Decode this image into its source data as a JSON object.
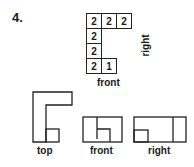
{
  "problem_number": "4.",
  "grid": {
    "cells": [
      {
        "row": 0,
        "col": 0,
        "value": "2"
      },
      {
        "row": 0,
        "col": 1,
        "value": "2"
      },
      {
        "row": 0,
        "col": 2,
        "value": "2"
      },
      {
        "row": 1,
        "col": 0,
        "value": "2"
      },
      {
        "row": 2,
        "col": 0,
        "value": "2"
      },
      {
        "row": 3,
        "col": 0,
        "value": "2"
      },
      {
        "row": 3,
        "col": 1,
        "value": "1"
      }
    ],
    "label_bottom": "front",
    "label_side": "right"
  },
  "views": {
    "top_label": "top",
    "front_label": "front",
    "right_label": "right"
  }
}
